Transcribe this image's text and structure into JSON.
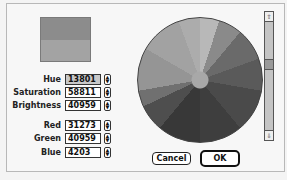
{
  "dialog": {
    "swatch": {
      "new_color": "#8c8c8c",
      "original_color": "#a3a3a3"
    },
    "fields": [
      {
        "label": "Hue",
        "value": "13801",
        "selected": true
      },
      {
        "label": "Saturation",
        "value": "58811"
      },
      {
        "label": "Brightness",
        "value": "40959"
      },
      {
        "label": "Red",
        "value": "31273"
      },
      {
        "label": "Green",
        "value": "40959"
      },
      {
        "label": "Blue",
        "value": "4203"
      }
    ],
    "stepper_icon": "up-down-arrows",
    "scrollbar": {
      "up_icon": "⇧",
      "down_icon": "⇩"
    },
    "buttons": {
      "cancel": "Cancel",
      "ok": "OK"
    }
  }
}
